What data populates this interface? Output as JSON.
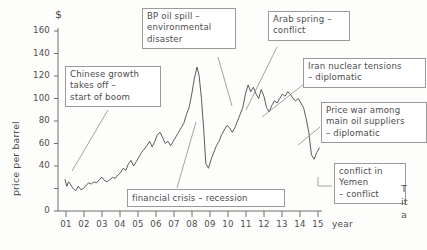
{
  "chart_data": {
    "type": "line",
    "title": "",
    "xlabel": "year",
    "ylabel": "price per barrel",
    "unit_symbol": "$",
    "ylim": [
      0,
      165
    ],
    "xlim": [
      2000.6,
      2015.6
    ],
    "grid": false,
    "legend": "none",
    "y_ticks": [
      0,
      20,
      40,
      60,
      80,
      100,
      120,
      140,
      160
    ],
    "y_tick_labels": [
      "0",
      "",
      "40",
      "60",
      "80",
      "100",
      "120",
      "140",
      "160"
    ],
    "x_ticks": [
      "01",
      "02",
      "03",
      "04",
      "05",
      "06",
      "07",
      "08",
      "09",
      "10",
      "11",
      "12",
      "13",
      "14",
      "15"
    ],
    "series": [
      {
        "name": "crude oil price",
        "x": [
          2001.0,
          2001.1,
          2001.2,
          2001.3,
          2001.45,
          2001.6,
          2001.75,
          2001.9,
          2002.05,
          2002.2,
          2002.35,
          2002.5,
          2002.65,
          2002.8,
          2002.95,
          2003.1,
          2003.25,
          2003.4,
          2003.55,
          2003.7,
          2003.85,
          2004.0,
          2004.15,
          2004.3,
          2004.45,
          2004.6,
          2004.75,
          2004.9,
          2005.05,
          2005.2,
          2005.35,
          2005.5,
          2005.65,
          2005.8,
          2005.95,
          2006.1,
          2006.25,
          2006.4,
          2006.55,
          2006.7,
          2006.85,
          2007.0,
          2007.15,
          2007.3,
          2007.45,
          2007.6,
          2007.75,
          2007.9,
          2008.05,
          2008.2,
          2008.35,
          2008.5,
          2008.62,
          2008.75,
          2008.88,
          2009.0,
          2009.15,
          2009.3,
          2009.45,
          2009.6,
          2009.75,
          2009.9,
          2010.05,
          2010.2,
          2010.35,
          2010.5,
          2010.65,
          2010.8,
          2010.95,
          2011.1,
          2011.25,
          2011.4,
          2011.55,
          2011.7,
          2011.85,
          2012.0,
          2012.15,
          2012.3,
          2012.45,
          2012.6,
          2012.75,
          2012.9,
          2013.05,
          2013.2,
          2013.35,
          2013.5,
          2013.65,
          2013.8,
          2013.95,
          2014.1,
          2014.25,
          2014.4,
          2014.55,
          2014.7,
          2014.85,
          2015.0,
          2015.15,
          2015.3,
          2015.45
        ],
        "values": [
          28,
          22,
          26,
          24,
          20,
          18,
          22,
          19,
          20,
          23,
          25,
          24,
          26,
          25,
          28,
          30,
          27,
          26,
          28,
          30,
          29,
          32,
          34,
          38,
          36,
          42,
          45,
          40,
          44,
          48,
          52,
          55,
          58,
          62,
          57,
          62,
          68,
          70,
          65,
          60,
          62,
          58,
          62,
          66,
          70,
          74,
          78,
          86,
          92,
          104,
          118,
          128,
          120,
          100,
          72,
          42,
          38,
          46,
          52,
          58,
          62,
          68,
          72,
          76,
          74,
          70,
          74,
          80,
          86,
          92,
          104,
          112,
          106,
          110,
          104,
          100,
          108,
          102,
          92,
          88,
          94,
          98,
          96,
          100,
          104,
          102,
          106,
          104,
          100,
          98,
          100,
          96,
          92,
          82,
          70,
          50,
          46,
          52,
          56
        ]
      }
    ],
    "annotations": [
      {
        "id": "chinese-growth",
        "text": "Chinese growth\ntakes off –\nstart of boom"
      },
      {
        "id": "bp-oil-spill",
        "text": "BP oil spill –\nenvironmental\ndisaster"
      },
      {
        "id": "arab-spring",
        "text": "Arab spring –\nconflict"
      },
      {
        "id": "iran-nuclear",
        "text": "Iran nuclear tensions\n– diplomatic"
      },
      {
        "id": "price-war",
        "text": "Price war among\nmain oil suppliers\n– diplomatic"
      },
      {
        "id": "yemen-conflict",
        "text": "conflict in\nYemen\n– conflict"
      },
      {
        "id": "financial-crisis",
        "text": "financial crisis – recession"
      }
    ]
  },
  "corner_note": "T\nit\na",
  "colors": {
    "line": "#4a4a4a",
    "axis": "#6e6e6e",
    "box_border": "#9a9a9a",
    "text": "#4c4c4c",
    "background": "#fdfdfc"
  }
}
